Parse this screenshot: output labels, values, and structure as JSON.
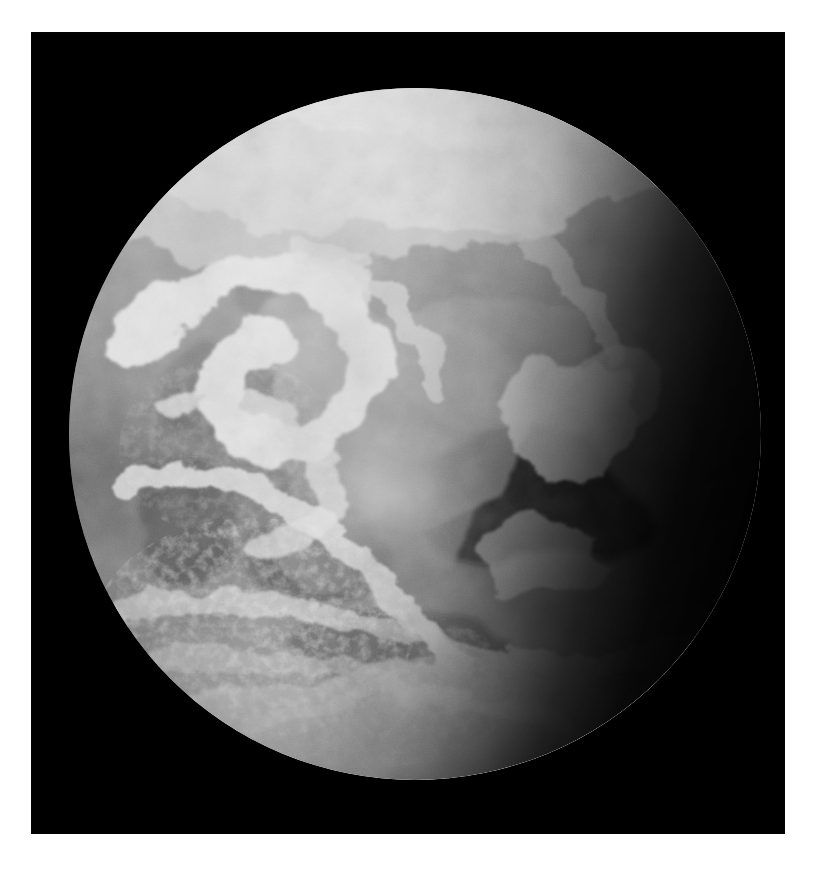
{
  "page": {
    "background_color": "#ffffff",
    "width": 829,
    "height": 873
  },
  "photograph": {
    "name": "earth-full-disc-photograph",
    "medium": "monochrome photographic print",
    "background_color": "#000000",
    "frame": {
      "left": 31,
      "top": 32,
      "width": 754,
      "height": 802
    },
    "alt_text": "Black and white photograph of the full disc of planet Earth seen from space against black space"
  },
  "earth": {
    "name": "earth-globe",
    "center_x": 384,
    "center_y": 402,
    "diameter": 692,
    "lit_fraction": "about two thirds of the disc is sunlit; the right limb falls into the night terminator",
    "features": [
      {
        "name": "north-polar-cloud-cap",
        "description": "bright high-albedo cloud and ice sheet across the top limb",
        "tone": "#d8d8d8"
      },
      {
        "name": "north-pacific-storm-spiral",
        "description": "large comma-shaped frontal cloud spiral in the upper left quadrant",
        "tone": "#e6e6e6"
      },
      {
        "name": "north-american-landmass",
        "description": "mottled mid-grey continent through the centre of the disc",
        "tone": "#8a8a8a"
      },
      {
        "name": "dark-ocean-basin",
        "description": "very dark water region in the right-of-centre lower quadrant",
        "tone": "#1a1a1a"
      },
      {
        "name": "sun-glint-highlight",
        "description": "diffuse specular bright patch near the sub-solar point",
        "tone": "#f2f2f2"
      },
      {
        "name": "equatorial-cloud-band",
        "description": "broken east-west band of cumulus across the lower middle",
        "tone": "#c6c6c6"
      },
      {
        "name": "southern-cloud-streets",
        "description": "fine stippled cellular cloud texture in the lower left quadrant",
        "tone": "#9e9e9e"
      },
      {
        "name": "southern-limb-brightening",
        "description": "bright swept cloud along the bottom limb",
        "tone": "#cccccc"
      },
      {
        "name": "night-terminator",
        "description": "dark crescent of unlit Earth down the right-hand limb",
        "tone": "#050505"
      }
    ],
    "palette": {
      "space_black": "#000000",
      "cloud_white": "#eeeeee",
      "land_grey": "#8a8a8a",
      "ocean_dark": "#1c1c1c",
      "terminator_black": "#060606"
    }
  }
}
